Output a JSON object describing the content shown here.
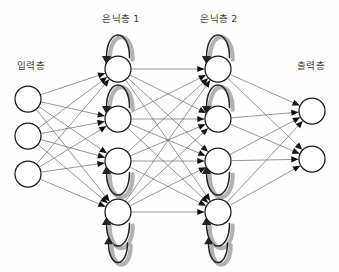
{
  "diagram": {
    "background_color": "#fefefe",
    "node_fill": "#ffffff",
    "node_stroke": "#1b1b1b",
    "edge_color": "#58585d",
    "arrow_color": "#111111",
    "loop_color": "#232323",
    "loop_shadow_color": "#b2b2b2"
  },
  "labels": {
    "input_layer": "입력층",
    "hidden_layer_1": "은닉층 1",
    "hidden_layer_2": "은닉층 2",
    "output_layer": "출력층",
    "caption": ""
  },
  "label_positions": {
    "input_layer": {
      "x": 31,
      "y": 66
    },
    "hidden_layer_1": {
      "x": 121,
      "y": 19
    },
    "hidden_layer_2": {
      "x": 219,
      "y": 19
    },
    "output_layer": {
      "x": 311,
      "y": 66
    },
    "caption": {
      "x": 170,
      "y": 266
    }
  },
  "layers": [
    {
      "id": "input",
      "name": "input-layer",
      "label": "입력층",
      "node_count": 3,
      "radius": 13,
      "nodes": [
        {
          "id": "i1",
          "x": 28,
          "y": 99
        },
        {
          "id": "i2",
          "x": 28,
          "y": 136
        },
        {
          "id": "i3",
          "x": 28,
          "y": 174
        }
      ]
    },
    {
      "id": "hidden1",
      "name": "hidden-layer-1",
      "label": "은닉층 1",
      "node_count": 4,
      "radius": 13,
      "recurrent": true,
      "nodes": [
        {
          "id": "h1_1",
          "x": 118,
          "y": 69,
          "loop": "up"
        },
        {
          "id": "h1_2",
          "x": 118,
          "y": 119,
          "loop": "up"
        },
        {
          "id": "h1_3",
          "x": 118,
          "y": 161,
          "loop": "down"
        },
        {
          "id": "h1_4",
          "x": 118,
          "y": 212,
          "loop": "down"
        }
      ]
    },
    {
      "id": "hidden2",
      "name": "hidden-layer-2",
      "label": "은닉층 2",
      "node_count": 4,
      "radius": 13,
      "recurrent": true,
      "nodes": [
        {
          "id": "h2_1",
          "x": 218,
          "y": 69,
          "loop": "up"
        },
        {
          "id": "h2_2",
          "x": 218,
          "y": 119,
          "loop": "up"
        },
        {
          "id": "h2_3",
          "x": 218,
          "y": 161,
          "loop": "down"
        },
        {
          "id": "h2_4",
          "x": 218,
          "y": 212,
          "loop": "down"
        }
      ]
    },
    {
      "id": "output",
      "name": "output-layer",
      "label": "출력층",
      "node_count": 2,
      "radius": 13,
      "nodes": [
        {
          "id": "o1",
          "x": 312,
          "y": 111
        },
        {
          "id": "o2",
          "x": 312,
          "y": 159
        }
      ]
    }
  ],
  "connections": [
    {
      "from_layer": "input",
      "to_layer": "hidden1",
      "type": "fully-connected",
      "arrowheads": true
    },
    {
      "from_layer": "hidden1",
      "to_layer": "hidden2",
      "type": "fully-connected",
      "arrowheads": true
    },
    {
      "from_layer": "hidden2",
      "to_layer": "output",
      "type": "fully-connected",
      "arrowheads": true
    }
  ]
}
